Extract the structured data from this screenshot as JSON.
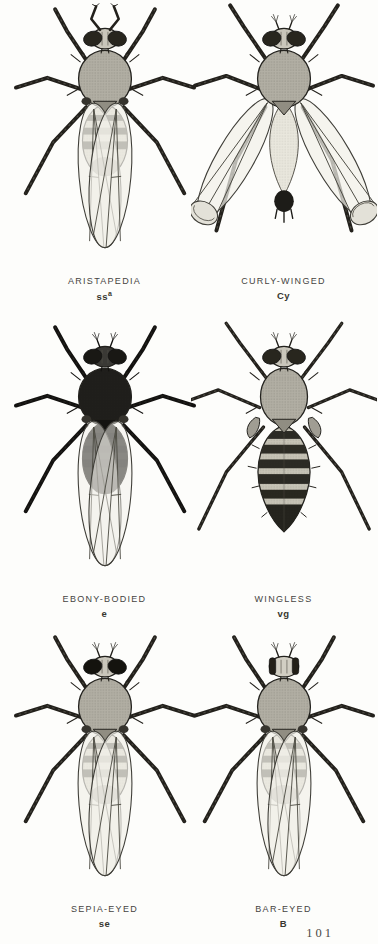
{
  "page": {
    "background": "#fdfdfb",
    "page_number": "101"
  },
  "figures": [
    {
      "name": "ARISTAPEDIA",
      "symbol": "ss",
      "symbol_sup": "a",
      "variant": "aristapedia"
    },
    {
      "name": "CURLY-WINGED",
      "symbol": "Cy",
      "variant": "curly"
    },
    {
      "name": "EBONY-BODIED",
      "symbol": "e",
      "variant": "ebony"
    },
    {
      "name": "WINGLESS",
      "symbol": "vg",
      "variant": "wingless"
    },
    {
      "name": "SEPIA-EYED",
      "symbol": "se",
      "variant": "sepia"
    },
    {
      "name": "BAR-EYED",
      "symbol": "B",
      "variant": "bar"
    }
  ],
  "colors": {
    "ink": "#23211c",
    "body_gray": "#b2afa4",
    "abdomen_light": "#d8d4c7",
    "ebony_body": "#1f1e1b",
    "wing_membrane": "#f1f0e9",
    "caption_text": "#45443f"
  }
}
